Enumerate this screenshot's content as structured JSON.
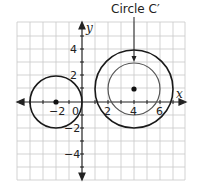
{
  "diagram": {
    "annotation": {
      "text": "Circle C′"
    },
    "axes": {
      "x_label": "x",
      "y_label": "y",
      "x_ticks": [
        {
          "value": -2,
          "text": "−2"
        },
        {
          "value": 0,
          "text": "0"
        },
        {
          "value": 2,
          "text": "2"
        },
        {
          "value": 4,
          "text": "4"
        },
        {
          "value": 6,
          "text": "6"
        }
      ],
      "y_ticks": [
        {
          "value": 4,
          "text": "4"
        },
        {
          "value": 2,
          "text": "2"
        },
        {
          "value": -2,
          "text": "−2"
        },
        {
          "value": -4,
          "text": "−4"
        }
      ],
      "grid_x_range": [
        -5,
        8
      ],
      "grid_y_range": [
        -6,
        6
      ]
    },
    "circles": [
      {
        "name": "circle-C",
        "center": [
          -2,
          0
        ],
        "radius": 2,
        "color": "#1a1a1a"
      },
      {
        "name": "circle-C-prime-outer",
        "center": [
          4,
          1
        ],
        "radius": 3,
        "color": "#1a1a1a"
      },
      {
        "name": "circle-inner",
        "center": [
          4,
          1
        ],
        "radius": 2,
        "color": "#555555"
      }
    ],
    "colors": {
      "grid": "#c8c8c8",
      "axis": "#222222"
    }
  }
}
